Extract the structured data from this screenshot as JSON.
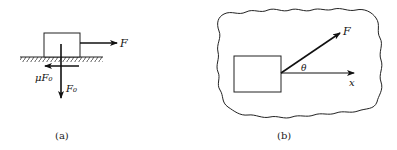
{
  "figure_a": {
    "caption": "(a)",
    "labels": {
      "applied_force": "F",
      "normal_force": "F₀",
      "friction_force": "μF₀"
    }
  },
  "figure_b": {
    "caption": "(b)",
    "labels": {
      "applied_force": "F",
      "angle": "θ",
      "axis": "x"
    }
  },
  "colors": {
    "ink": "#111111",
    "background": "#ffffff"
  }
}
